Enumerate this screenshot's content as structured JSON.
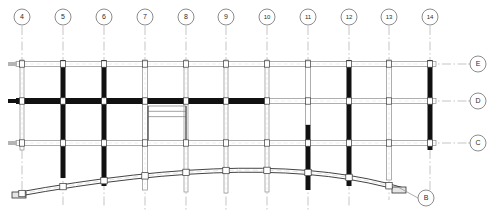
{
  "drawing": {
    "type": "structural-framing-plan",
    "title": "",
    "background_color": "#ffffff",
    "ink_color": "#1a1a1a",
    "beam_solid_color": "#111111",
    "beam_hollow_fill": "#ffffff",
    "beam_hollow_stroke": "#8c8c8c",
    "gridline_color": "#9a9a9a",
    "bubble_stroke": "#6e6e6e",
    "bubble_radius": 8,
    "width": 494,
    "height": 221
  },
  "column_grid": {
    "axis_label": "",
    "leader_top_y": 26,
    "bubble_cy": 17,
    "lines": [
      {
        "label": "4",
        "x": 22,
        "bubble_cx": 22,
        "line_top": 26,
        "line_bottom": 196,
        "dashed": true
      },
      {
        "label": "5",
        "x": 63,
        "bubble_cx": 63,
        "line_top": 26,
        "line_bottom": 205,
        "dashed": true
      },
      {
        "label": "6",
        "x": 104,
        "bubble_cx": 104,
        "line_top": 26,
        "line_bottom": 208,
        "dashed": true
      },
      {
        "label": "7",
        "x": 145,
        "bubble_cx": 145,
        "line_top": 26,
        "line_bottom": 210,
        "dashed": true
      },
      {
        "label": "8",
        "x": 186,
        "bubble_cx": 186,
        "line_top": 26,
        "line_bottom": 212,
        "dashed": true
      },
      {
        "label": "9",
        "x": 226,
        "bubble_cx": 226,
        "line_top": 26,
        "line_bottom": 212,
        "dashed": true
      },
      {
        "label": "10",
        "x": 267,
        "bubble_cx": 267,
        "line_top": 26,
        "line_bottom": 212,
        "dashed": true
      },
      {
        "label": "11",
        "x": 308,
        "bubble_cx": 308,
        "line_top": 26,
        "line_bottom": 210,
        "dashed": true
      },
      {
        "label": "12",
        "x": 349,
        "bubble_cx": 349,
        "line_top": 26,
        "line_bottom": 208,
        "dashed": true
      },
      {
        "label": "13",
        "x": 389,
        "bubble_cx": 389,
        "line_top": 26,
        "line_bottom": 200,
        "dashed": true
      },
      {
        "label": "14",
        "x": 430,
        "bubble_cx": 430,
        "line_top": 26,
        "line_bottom": 196,
        "dashed": true
      }
    ]
  },
  "row_grid": {
    "bubble_cx": 478,
    "lines": [
      {
        "label": "E",
        "y": 64,
        "bubble_cy": 64,
        "line_left": 8,
        "line_right": 468,
        "dashed": true
      },
      {
        "label": "D",
        "y": 101,
        "bubble_cy": 101,
        "line_left": 8,
        "line_right": 468,
        "dashed": true
      },
      {
        "label": "C",
        "y": 143,
        "bubble_cy": 143,
        "line_left": 8,
        "line_right": 468,
        "dashed": true
      },
      {
        "label": "B",
        "y": 198,
        "bubble_cy": 198,
        "bubble_cx": 426,
        "leader_from_x": 398,
        "leader_from_y": 187,
        "dashed": false
      }
    ]
  },
  "beams": {
    "legend": {
      "solid": "filled beam",
      "hollow": "hollow / double-line beam"
    },
    "horizontal": [
      {
        "name": "beam-E-run",
        "y": 64,
        "x1": 16,
        "x2": 436,
        "style": "hollow",
        "thickness": 5
      },
      {
        "name": "beam-D-run",
        "y": 101,
        "x1": 16,
        "x2": 436,
        "style": "mixed",
        "thickness": 6
      },
      {
        "name": "beam-C-run",
        "y": 143,
        "x1": 16,
        "x2": 436,
        "style": "hollow",
        "thickness": 5
      }
    ],
    "vertical_bays": [
      {
        "name": "col-4",
        "x": 22,
        "y1": 60,
        "y2": 150,
        "style": "hollow",
        "thickness": 4
      },
      {
        "name": "col-5",
        "x": 63,
        "y1": 60,
        "y2": 178,
        "style": "solid",
        "thickness": 5
      },
      {
        "name": "col-6",
        "x": 104,
        "y1": 60,
        "y2": 186,
        "style": "solid",
        "thickness": 5
      },
      {
        "name": "col-7",
        "x": 145,
        "y1": 60,
        "y2": 190,
        "style": "hollow",
        "thickness": 5
      },
      {
        "name": "col-8",
        "x": 186,
        "y1": 60,
        "y2": 192,
        "style": "hollow",
        "thickness": 4
      },
      {
        "name": "col-9",
        "x": 226,
        "y1": 60,
        "y2": 193,
        "style": "hollow",
        "thickness": 4
      },
      {
        "name": "col-10",
        "x": 267,
        "y1": 60,
        "y2": 192,
        "style": "hollow",
        "thickness": 4
      },
      {
        "name": "col-11",
        "x": 308,
        "y1": 60,
        "y2": 190,
        "style": "mixed",
        "thickness": 5
      },
      {
        "name": "col-12",
        "x": 349,
        "y1": 60,
        "y2": 186,
        "style": "solid",
        "thickness": 5
      },
      {
        "name": "col-13",
        "x": 389,
        "y1": 60,
        "y2": 180,
        "style": "hollow",
        "thickness": 5
      },
      {
        "name": "col-14",
        "x": 430,
        "y1": 60,
        "y2": 150,
        "style": "solid",
        "thickness": 5
      }
    ]
  },
  "curved_member": {
    "name": "arched-beam",
    "description": "double-line arched beam spanning grid 4 to past grid 13",
    "start": {
      "x": 14,
      "y": 193
    },
    "peak": {
      "x": 268,
      "y": 160
    },
    "end": {
      "x": 404,
      "y": 188
    },
    "thickness": 4,
    "style": "hollow"
  },
  "stair": {
    "name": "stair-opening",
    "x": 148,
    "y": 106,
    "width": 38,
    "height": 38,
    "treads": 2,
    "style": "hollow"
  },
  "stair_upper": {
    "name": "stair-upper-run",
    "x": 148,
    "y": 106,
    "width": 38,
    "height": 12
  }
}
